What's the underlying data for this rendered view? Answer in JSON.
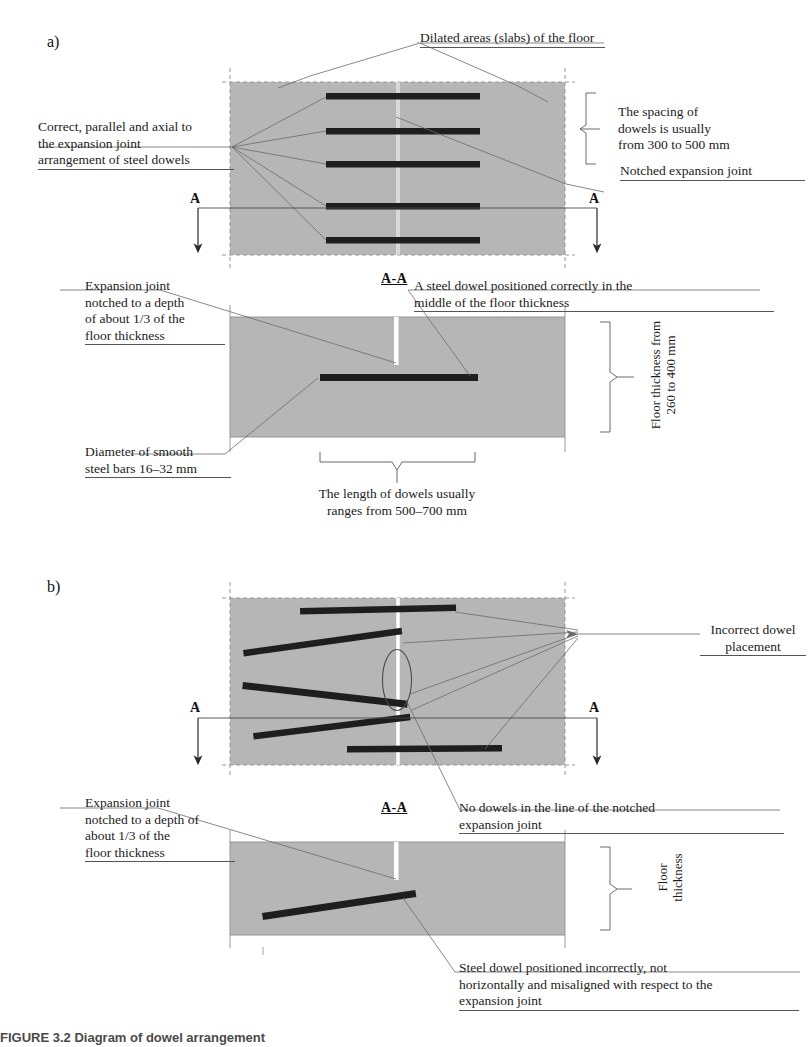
{
  "figure": {
    "caption": "FIGURE 3.2   Diagram of dowel arrangement",
    "panels": [
      {
        "key": "a",
        "letter": "a)"
      },
      {
        "key": "b",
        "letter": "b)"
      }
    ],
    "section_title": "A-A",
    "section_marker": "A",
    "colors": {
      "slab_fill": "#b6b6b6",
      "dowel": "#1e1e1e",
      "leader_line": "#6b6b6b",
      "text": "#1c1c1c",
      "joint_white": "#ffffff"
    }
  },
  "panel_a": {
    "letter": "a)",
    "plan": {
      "labels": {
        "top": "Dilated areas (slabs) of the floor",
        "left": "Correct, parallel and axial to\nthe expansion joint\narrangement of steel dowels",
        "right_spacing": "The spacing of\ndowels is usually\nfrom 300 to 500 mm",
        "right_joint": "Notched expansion joint"
      },
      "marker_left": "A",
      "marker_right": "A",
      "dowel_count": 5
    },
    "section": {
      "title": "A-A",
      "labels": {
        "left_top": "Expansion joint\nnotched to a depth\nof about 1/3 of the\nfloor thickness",
        "right_top": "A steel dowel positioned correctly in the\nmiddle of the floor thickness",
        "left_bottom": "Diameter of smooth\nsteel bars 16–32 mm",
        "right_vertical": "Floor thickness from\n260 to 400 mm",
        "bottom": "The length of dowels usually\nranges from 500–700 mm"
      }
    }
  },
  "panel_b": {
    "letter": "b)",
    "plan": {
      "labels": {
        "right": "Incorrect dowel\nplacement"
      },
      "marker_left": "A",
      "marker_right": "A",
      "dowel_count": 5
    },
    "section": {
      "title": "A-A",
      "labels": {
        "left_top": "Expansion joint\nnotched to a depth of\nabout 1/3 of the\nfloor thickness",
        "right_top": "No dowels in the line of the notched\nexpansion joint",
        "right_vertical": "Floor\nthickness",
        "bottom": "Steel dowel positioned incorrectly, not\nhorizontally and misaligned with respect to the\nexpansion joint"
      }
    }
  }
}
